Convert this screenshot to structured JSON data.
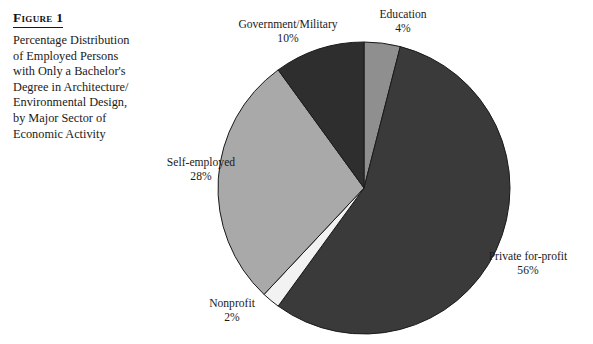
{
  "figure": {
    "title": "Figure 1",
    "caption_lines": [
      "Percentage Distribution",
      "of Employed Persons",
      "with Only a Bachelor's",
      "Degree in Architecture/",
      "Environmental Design,",
      "by Major Sector of",
      "Economic Activity"
    ]
  },
  "labels": {
    "government": {
      "name": "Government/Military",
      "value": "10%"
    },
    "education": {
      "name": "Education",
      "value": "4%"
    },
    "private": {
      "name": "Private for-profit",
      "value": "56%"
    },
    "nonprofit": {
      "name": "Nonprofit",
      "value": "2%"
    },
    "self": {
      "name": "Self-employed",
      "value": "28%"
    }
  },
  "chart_data": {
    "type": "pie",
    "units": "percent",
    "start_angle_deg": 0,
    "direction": "clockwise",
    "categories": [
      "Education",
      "Private for-profit",
      "Nonprofit",
      "Self-employed",
      "Government/Military"
    ],
    "values": [
      4,
      56,
      2,
      28,
      10
    ],
    "total": 100,
    "colors": [
      "#8f8f8f",
      "#3a3a3a",
      "#f2f2f2",
      "#a9a9a9",
      "#2e2e2e"
    ],
    "slice_outline_color": "#1a1a1a",
    "labels_shown": [
      "Education 4%",
      "Private for-profit 56%",
      "Nonprofit 2%",
      "Self-employed 28%",
      "Government/Military 10%"
    ],
    "legend": "none",
    "grid": false,
    "background": "#ffffff"
  }
}
